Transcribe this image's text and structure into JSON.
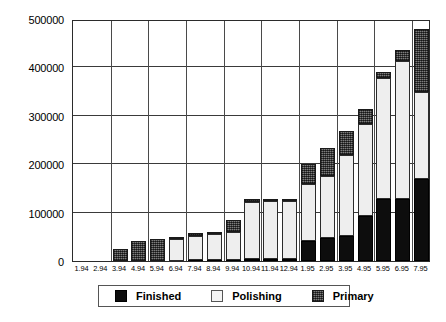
{
  "chart_data": {
    "type": "bar",
    "stacked": true,
    "title": "",
    "xlabel": "",
    "ylabel": "",
    "ylim": [
      0,
      500000
    ],
    "ytick_labels": [
      "0",
      "100000",
      "200000",
      "300000",
      "400000",
      "500000"
    ],
    "ytick_values": [
      0,
      100000,
      200000,
      300000,
      400000,
      500000
    ],
    "grid": true,
    "legend_position": "bottom",
    "categories": [
      "1.94",
      "2.94",
      "3.94",
      "4.94",
      "5.94",
      "6.94",
      "7.94",
      "8.94",
      "9.94",
      "10.94",
      "11.94",
      "12.94",
      "1.95",
      "2.95",
      "3.95",
      "4.95",
      "5.95",
      "6.95",
      "7.95"
    ],
    "series": [
      {
        "name": "Finished",
        "color": "#0d0d0d",
        "values": [
          0,
          0,
          0,
          0,
          0,
          0,
          2000,
          3000,
          3000,
          4000,
          4000,
          4000,
          42000,
          47000,
          52000,
          93000,
          128000,
          128000,
          170000
        ]
      },
      {
        "name": "Polishing",
        "color": "#eeeeee",
        "values": [
          0,
          0,
          0,
          0,
          0,
          46000,
          50000,
          53000,
          56000,
          118000,
          121000,
          121000,
          118000,
          128000,
          167000,
          190000,
          250000,
          285000,
          180000
        ]
      },
      {
        "name": "Primary",
        "color": "#5a5a5a",
        "values": [
          0,
          0,
          24000,
          42000,
          45000,
          2000,
          6000,
          4000,
          26000,
          6000,
          3000,
          3000,
          40000,
          58000,
          50000,
          32000,
          12000,
          22000,
          130000
        ]
      }
    ],
    "totals": [
      0,
      0,
      24000,
      42000,
      45000,
      48000,
      58000,
      60000,
      85000,
      128000,
      128000,
      128000,
      200000,
      233000,
      269000,
      315000,
      390000,
      435000,
      480000
    ]
  },
  "legend": {
    "items": [
      {
        "label": "Finished",
        "swatch": "finished-swatch"
      },
      {
        "label": "Polishing",
        "swatch": "polishing-swatch"
      },
      {
        "label": "Primary",
        "swatch": "primary-swatch"
      }
    ]
  }
}
